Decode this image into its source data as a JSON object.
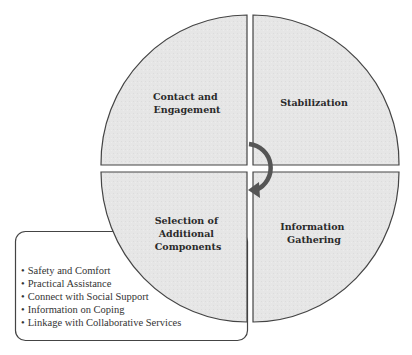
{
  "diagram": {
    "type": "quadrant-cycle",
    "quadrants": [
      {
        "position": "top-left",
        "lines": [
          "Contact and",
          "Engagement"
        ]
      },
      {
        "position": "top-right",
        "lines": [
          "Stabilization"
        ]
      },
      {
        "position": "bottom-right",
        "lines": [
          "Information",
          "Gathering"
        ]
      },
      {
        "position": "bottom-left",
        "lines": [
          "Selection of",
          "Additional",
          "Components"
        ]
      }
    ],
    "cycle_arrow": {
      "direction": "clockwise",
      "icon": "curved-arrow-icon"
    },
    "callout": {
      "attached_to": "bottom-left",
      "bullet": "•",
      "items": [
        "Safety and Comfort",
        "Practical Assistance",
        "Connect with Social Support",
        "Information on Coping",
        "Linkage with Collaborative Services"
      ]
    },
    "colors": {
      "quadrant_fill": "#e6e6e6",
      "outline": "#444444",
      "arrow": "#555555",
      "text": "#2a2a2a"
    }
  }
}
